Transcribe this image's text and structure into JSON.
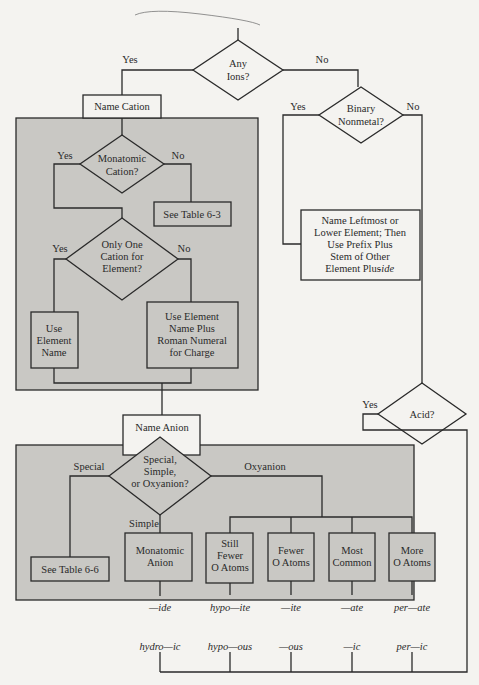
{
  "diagram": {
    "colors": {
      "background": "#f4f3f0",
      "panel": "#c9c8c4",
      "line": "#2a2a2a",
      "box": "#f4f3f0"
    },
    "any_ions": {
      "lines": [
        "Any",
        "Ions?"
      ],
      "yes": "Yes",
      "no": "No"
    },
    "name_cation": "Name Cation",
    "monatomic_cation": {
      "lines": [
        "Monatomic",
        "Cation?"
      ],
      "yes": "Yes",
      "no": "No"
    },
    "see_table_63": "See Table 6-3",
    "only_one_cation": {
      "lines": [
        "Only One",
        "Cation for",
        "Element?"
      ],
      "yes": "Yes",
      "no": "No"
    },
    "use_element_name": [
      "Use",
      "Element",
      "Name"
    ],
    "use_roman": [
      "Use Element",
      "Name Plus",
      "Roman Numeral",
      "for Charge"
    ],
    "binary_nonmetal": {
      "lines": [
        "Binary",
        "Nonmetal?"
      ],
      "yes": "Yes",
      "no": "No"
    },
    "name_leftmost": [
      "Name Leftmost or",
      "Lower Element; Then",
      "Use Prefix Plus",
      "Stem of Other",
      "Element Plus "
    ],
    "name_leftmost_suffix": "-ide",
    "acid": {
      "lines": [
        "Acid?"
      ],
      "yes": "Yes"
    },
    "name_anion": "Name Anion",
    "anion_type": {
      "lines": [
        "Special,",
        "Simple,",
        "or Oxyanion?"
      ],
      "special": "Special",
      "simple": "Simple",
      "oxyanion": "Oxyanion"
    },
    "see_table_66": "See Table 6-6",
    "monatomic_anion": [
      "Monatomic",
      "Anion"
    ],
    "oxy_boxes": [
      {
        "lines": [
          "Still",
          "Fewer",
          "O Atoms"
        ],
        "suffix": "hypo—ite",
        "acid": "hypo—ous"
      },
      {
        "lines": [
          "Fewer",
          "O Atoms"
        ],
        "suffix": "—ite",
        "acid": "—ous"
      },
      {
        "lines": [
          "Most",
          "Common"
        ],
        "suffix": "—ate",
        "acid": "—ic"
      },
      {
        "lines": [
          "More",
          "O Atoms"
        ],
        "suffix": "per—ate",
        "acid": "per—ic"
      }
    ],
    "ide_suffix": "—ide",
    "hydro_acid": "hydro—ic"
  }
}
